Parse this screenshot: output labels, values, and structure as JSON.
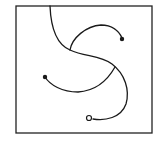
{
  "diagram": {
    "type": "curve-figure",
    "frame": {
      "x": 16,
      "y": 6,
      "width": 136,
      "height": 127,
      "stroke": "#222222"
    },
    "stroke_color": "#1a1a1a",
    "curves": [
      {
        "name": "main-s-curve",
        "d": "M50,6 C51,30 58,45 70,50 C85,57 100,55 112,64 C125,74 130,90 126,104 C121,118 105,121 93,119",
        "end": {
          "type": "loop",
          "cx": 89,
          "cy": 118,
          "r": 2.5
        }
      },
      {
        "name": "upper-branch-curve",
        "d": "M70,50 C72,38 86,26 101,25 C112,25 119,31 122,38",
        "end": {
          "type": "dot",
          "cx": 122,
          "cy": 39,
          "r": 1.6
        }
      },
      {
        "name": "lower-branch-curve",
        "d": "M115,67 C106,83 94,91 78,92 C62,92 50,85 45,77",
        "end": {
          "type": "dot",
          "cx": 45,
          "cy": 77,
          "r": 1.6
        }
      }
    ]
  }
}
